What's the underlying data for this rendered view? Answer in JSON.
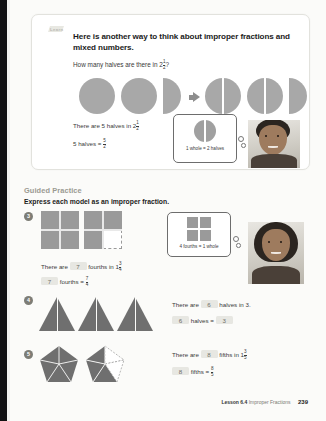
{
  "learn": {
    "tab_label": "Learn",
    "title": "Here is another way to think about improper fractions and mixed numbers.",
    "question_prefix": "How many halves are there in 2",
    "question_frac_n": "1",
    "question_frac_d": "2",
    "question_suffix": "?",
    "statement1_prefix": "There are 5 halves in 2",
    "statement1_frac_n": "1",
    "statement1_frac_d": "2",
    "statement2_prefix": "5 halves =",
    "statement2_frac_n": "5",
    "statement2_frac_d": "2",
    "callout_text": "1 whole = 2 halves"
  },
  "guided_practice": {
    "heading": "Guided Practice",
    "instruction": "Express each model as an improper fraction.",
    "callout_text": "4 fourths = 1 whole",
    "problems": [
      {
        "number": "3",
        "model": "squares-fourths",
        "line1_prefix": "There are",
        "line1_answer": "7",
        "line1_middle": "fourths in 1",
        "line1_frac_n": "3",
        "line1_frac_d": "4",
        "line2_answer": "7",
        "line2_middle": "fourths  =",
        "line2_frac_n": "7",
        "line2_frac_d": "4"
      },
      {
        "number": "4",
        "model": "triangles-halves",
        "line1_prefix": "There are",
        "line1_answer": "6",
        "line1_middle": "halves in 3.",
        "line1_frac_n": "",
        "line1_frac_d": "",
        "line2_answer": "6",
        "line2_middle": "halves  =",
        "line2_result": "3"
      },
      {
        "number": "5",
        "model": "pentagons-fifths",
        "line1_prefix": "There are",
        "line1_answer": "8",
        "line1_middle": "fifths in 1",
        "line1_frac_n": "3",
        "line1_frac_d": "5",
        "line2_answer": "8",
        "line2_middle": "fifths  =",
        "line2_frac_n": "8",
        "line2_frac_d": "5"
      }
    ]
  },
  "footer": {
    "lesson": "Lesson 6.4",
    "topic": "Improper Fractions",
    "page": "239"
  },
  "colors": {
    "shape_fill": "#a8a8a8",
    "triangle_fill": "#6f6f6f",
    "answer_box": "#e7e7e2",
    "heading_gray": "#9a9a92"
  }
}
